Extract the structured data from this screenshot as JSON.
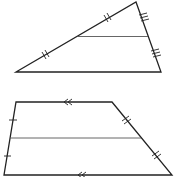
{
  "diagram": {
    "stroke_color": "#222222",
    "midline_color": "#555555",
    "figures": [
      {
        "type": "triangle",
        "vertices": [
          [
            16,
            72
          ],
          [
            136,
            2
          ],
          [
            161,
            72
          ]
        ],
        "midsegment": [
          [
            78,
            37
          ],
          [
            148,
            37
          ]
        ],
        "marks": "double ticks on left side halves, triple ticks on right side halves"
      },
      {
        "type": "trapezoid",
        "vertices": [
          [
            16,
            102
          ],
          [
            112,
            102
          ],
          [
            172,
            175
          ],
          [
            4,
            175
          ]
        ],
        "midsegment": [
          [
            10,
            138
          ],
          [
            141,
            138
          ]
        ],
        "marks": "single ticks on left leg halves, double ticks on right leg halves, double chevrons on parallel bases"
      }
    ]
  }
}
